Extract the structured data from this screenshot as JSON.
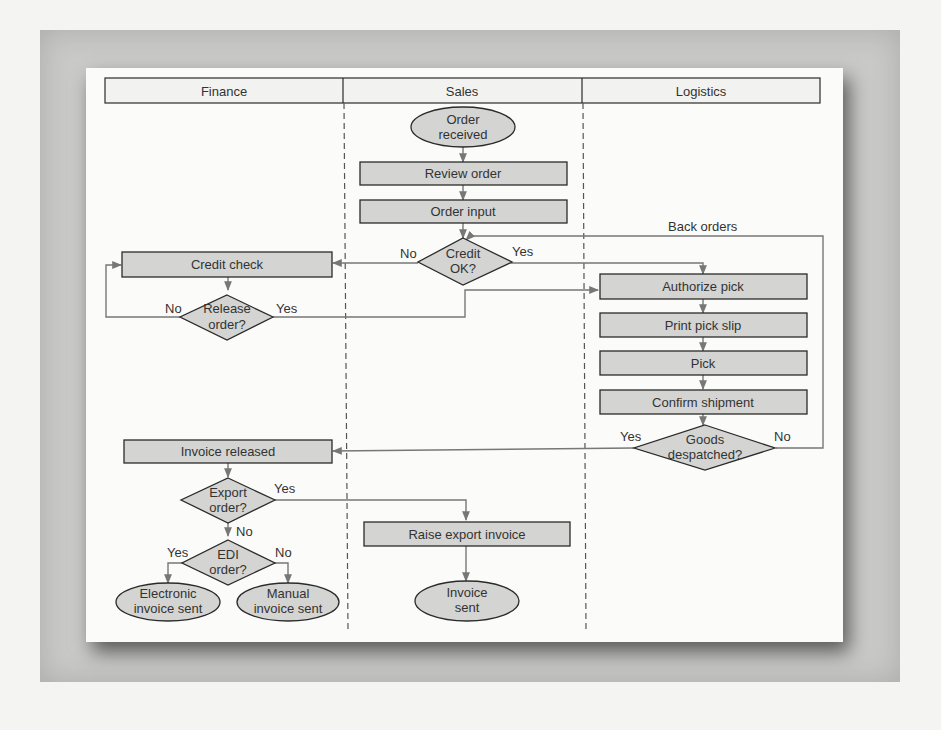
{
  "diagram": {
    "type": "swimlane-flowchart",
    "lanes": [
      {
        "id": "finance",
        "label": "Finance"
      },
      {
        "id": "sales",
        "label": "Sales"
      },
      {
        "id": "logistics",
        "label": "Logistics"
      }
    ],
    "nodes": {
      "order_received": {
        "line1": "Order",
        "line2": "received",
        "shape": "ellipse",
        "lane": "sales"
      },
      "review_order": {
        "label": "Review order",
        "shape": "process",
        "lane": "sales"
      },
      "order_input": {
        "label": "Order input",
        "shape": "process",
        "lane": "sales"
      },
      "credit_ok": {
        "line1": "Credit",
        "line2": "OK?",
        "shape": "decision",
        "lane": "sales"
      },
      "credit_check": {
        "label": "Credit check",
        "shape": "process",
        "lane": "finance"
      },
      "release_order": {
        "line1": "Release",
        "line2": "order?",
        "shape": "decision",
        "lane": "finance"
      },
      "authorize_pick": {
        "label": "Authorize pick",
        "shape": "process",
        "lane": "logistics"
      },
      "print_pick_slip": {
        "label": "Print pick slip",
        "shape": "process",
        "lane": "logistics"
      },
      "pick": {
        "label": "Pick",
        "shape": "process",
        "lane": "logistics"
      },
      "confirm_shipment": {
        "label": "Confirm shipment",
        "shape": "process",
        "lane": "logistics"
      },
      "goods_despatched": {
        "line1": "Goods",
        "line2": "despatched?",
        "shape": "decision",
        "lane": "logistics"
      },
      "invoice_released": {
        "label": "Invoice released",
        "shape": "process",
        "lane": "finance"
      },
      "export_order": {
        "line1": "Export",
        "line2": "order?",
        "shape": "decision",
        "lane": "finance"
      },
      "edi_order": {
        "line1": "EDI",
        "line2": "order?",
        "shape": "decision",
        "lane": "finance"
      },
      "electronic_invoice_sent": {
        "line1": "Electronic",
        "line2": "invoice sent",
        "shape": "ellipse",
        "lane": "finance"
      },
      "manual_invoice_sent": {
        "line1": "Manual",
        "line2": "invoice sent",
        "shape": "ellipse",
        "lane": "finance"
      },
      "raise_export_invoice": {
        "label": "Raise export invoice",
        "shape": "process",
        "lane": "sales"
      },
      "invoice_sent": {
        "line1": "Invoice",
        "line2": "sent",
        "shape": "ellipse",
        "lane": "sales"
      }
    },
    "edge_labels": {
      "credit_no": "No",
      "credit_yes": "Yes",
      "release_no": "No",
      "release_yes": "Yes",
      "back_orders": "Back orders",
      "goods_yes": "Yes",
      "goods_no": "No",
      "export_yes": "Yes",
      "export_no": "No",
      "edi_yes": "Yes",
      "edi_no": "No"
    },
    "edges": [
      {
        "from": "order_received",
        "to": "review_order"
      },
      {
        "from": "review_order",
        "to": "order_input"
      },
      {
        "from": "order_input",
        "to": "credit_ok"
      },
      {
        "from": "credit_ok",
        "to": "credit_check",
        "label": "No"
      },
      {
        "from": "credit_ok",
        "to": "authorize_pick",
        "label": "Yes"
      },
      {
        "from": "credit_check",
        "to": "release_order"
      },
      {
        "from": "release_order",
        "to": "credit_check",
        "label": "No"
      },
      {
        "from": "release_order",
        "to": "authorize_pick",
        "label": "Yes"
      },
      {
        "from": "authorize_pick",
        "to": "print_pick_slip"
      },
      {
        "from": "print_pick_slip",
        "to": "pick"
      },
      {
        "from": "pick",
        "to": "confirm_shipment"
      },
      {
        "from": "confirm_shipment",
        "to": "goods_despatched"
      },
      {
        "from": "goods_despatched",
        "to": "credit_ok",
        "label": "No (Back orders)"
      },
      {
        "from": "goods_despatched",
        "to": "invoice_released",
        "label": "Yes"
      },
      {
        "from": "invoice_released",
        "to": "export_order"
      },
      {
        "from": "export_order",
        "to": "raise_export_invoice",
        "label": "Yes"
      },
      {
        "from": "export_order",
        "to": "edi_order",
        "label": "No"
      },
      {
        "from": "edi_order",
        "to": "electronic_invoice_sent",
        "label": "Yes"
      },
      {
        "from": "edi_order",
        "to": "manual_invoice_sent",
        "label": "No"
      },
      {
        "from": "raise_export_invoice",
        "to": "invoice_sent"
      }
    ],
    "colors": {
      "shape_fill": "#d4d4d2",
      "shape_stroke": "#2a2a2a",
      "connector": "#777777",
      "lane_divider": "#555555",
      "card_bg": "#fbfbfa",
      "frame_bg": "#c9c9c7"
    }
  }
}
